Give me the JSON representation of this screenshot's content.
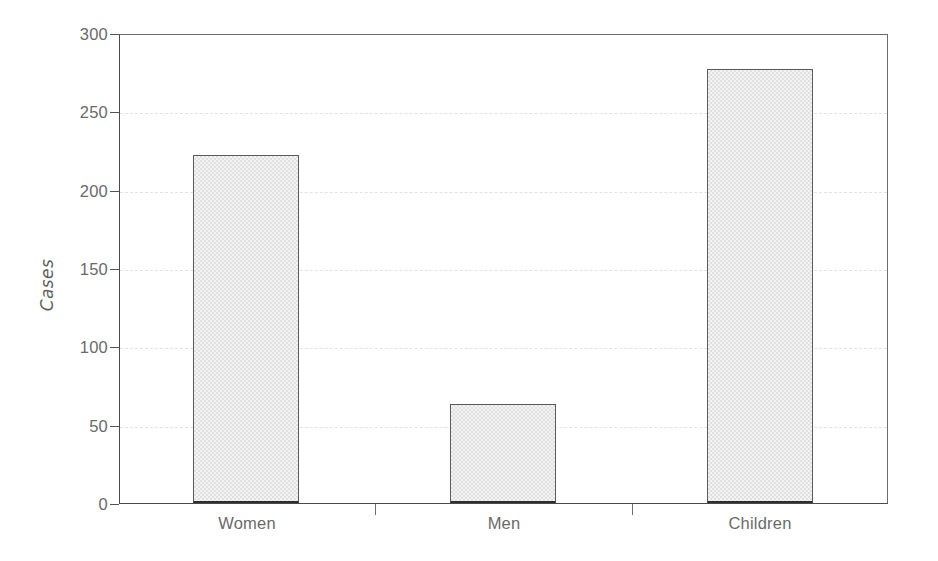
{
  "chart_data": {
    "type": "bar",
    "title": "",
    "subtitle": "",
    "xlabel": "",
    "ylabel": "Cases",
    "categories": [
      "Women",
      "Men",
      "Children"
    ],
    "values": [
      222,
      63,
      277
    ],
    "series": [
      {
        "name": "Cases",
        "values": [
          222,
          63,
          277
        ]
      }
    ],
    "ylim": [
      0,
      300
    ],
    "yticks": [
      0,
      50,
      100,
      150,
      200,
      250,
      300
    ],
    "ytick_labels": [
      "0",
      "50",
      "100",
      "150",
      "200",
      "250",
      "300"
    ],
    "grid": "horizontal-dashed",
    "legend": "none",
    "annotations": [],
    "colors": {
      "bar_fill": "#ebebeb",
      "bar_edge": "#5a5a5a",
      "axis": "#4a4a4a",
      "gridline": "#e2e2e2",
      "tick_label": "#6a6a6a",
      "axis_title": "#5f5f5f",
      "background": "#ffffff"
    }
  }
}
